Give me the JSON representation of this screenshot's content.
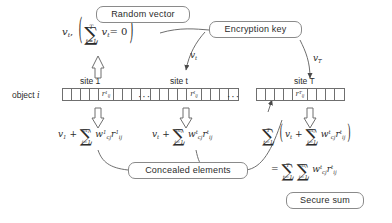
{
  "diagram": {
    "boxes": {
      "random_vector": "Random vector",
      "encryption_key": "Encryption key",
      "concealed_elements": "Concealed elements",
      "secure_sum": "Secure sum"
    },
    "labels": {
      "object": "object",
      "object_index": "i",
      "site_1": "site 1",
      "site_t": "site t",
      "site_T": "site T",
      "key_vt": "v",
      "key_vt_sub": "t",
      "key_vT": "v",
      "key_vT_sub": "T",
      "ellipsis": "···"
    },
    "formulas": {
      "random_vector_expr": {
        "lead_var": "v",
        "lead_sub": "t",
        "sum_top": "T",
        "sum_bot": "t=1",
        "body_var": "v",
        "body_sub": "t",
        "equals": "= 0"
      },
      "site_1_expr": {
        "lead_var": "v",
        "lead_sub": "1",
        "plus": "+",
        "sum_top": "m",
        "sum_top_sub": "1",
        "sum_bot": "j=1",
        "w": "w",
        "w_sub": "cj",
        "w_sup": "1",
        "r": "r",
        "r_sub": "ij",
        "r_sup": "1"
      },
      "site_t_expr": {
        "lead_var": "v",
        "lead_sub": "t",
        "plus": "+",
        "sum_top": "m",
        "sum_top_sub": "t",
        "sum_bot": "j=1",
        "w": "w",
        "w_sub": "cj",
        "w_sup": "t",
        "r": "r",
        "r_sub": "ij",
        "r_sup": "t"
      },
      "total_expr": {
        "outer_top": "T",
        "outer_bot": "t=1",
        "lead_var": "v",
        "lead_sub": "t",
        "plus": "+",
        "inner_top": "m",
        "inner_top_sub": "t",
        "inner_bot": "j=1",
        "w": "w",
        "w_sub": "cj",
        "w_sup": "t",
        "r": "r",
        "r_sub": "ij",
        "r_sup": "t"
      },
      "result_expr": {
        "equals": "=",
        "outer_top": "T",
        "outer_bot": "t=1",
        "inner_top": "m",
        "inner_top_sub": "t",
        "inner_bot": "j=1",
        "w": "w",
        "w_sub": "cj",
        "w_sup": "t",
        "r": "r",
        "r_sub": "ij",
        "r_sup": "t"
      }
    },
    "arrays": {
      "site_1_value": "r",
      "site_1_value_sub": "ij",
      "site_1_value_sup": "1",
      "site_t_value": "r",
      "site_t_value_sub": "ij",
      "site_t_value_sup": "t",
      "site_T_value": "r",
      "site_T_value_sub": "ij",
      "site_T_value_sup": "T",
      "cells_before": 4,
      "cells_after": 4
    },
    "colors": {
      "line": "#6f6f6f",
      "box_border": "#8a8a8a",
      "text": "#2b2b2b",
      "background": "#ffffff"
    }
  }
}
